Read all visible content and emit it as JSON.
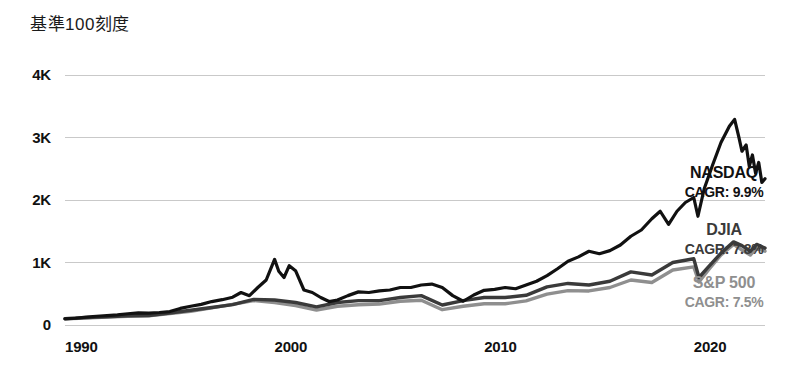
{
  "chart_data": {
    "type": "line",
    "title": "基準100刻度",
    "xlabel": "",
    "ylabel": "",
    "xlim": [
      1990,
      2023.4
    ],
    "ylim": [
      0,
      4000
    ],
    "grid": true,
    "legend_position": "right-inline",
    "y_ticks": [
      {
        "value": 0,
        "label": "0"
      },
      {
        "value": 1000,
        "label": "1K"
      },
      {
        "value": 2000,
        "label": "2K"
      },
      {
        "value": 3000,
        "label": "3K"
      },
      {
        "value": 4000,
        "label": "4K"
      }
    ],
    "x_ticks": [
      {
        "value": 1990,
        "label": "1990"
      },
      {
        "value": 2000,
        "label": "2000"
      },
      {
        "value": 2010,
        "label": "2010"
      },
      {
        "value": 2020,
        "label": "2020"
      }
    ],
    "colors": {
      "nasdaq": "#111111",
      "djia": "#3a3a3a",
      "sp500": "#8f8f8f",
      "grid": "#c9c9c9",
      "axis_text": "#111111",
      "title_text": "#1b1b1b"
    },
    "series": [
      {
        "name": "NASDAQ",
        "cagr_label": "CAGR: 9.9%",
        "color": "#111111",
        "x": [
          1990,
          1990.5,
          1991,
          1991.5,
          1992,
          1992.5,
          1993,
          1993.5,
          1994,
          1994.5,
          1995,
          1995.5,
          1996,
          1996.5,
          1997,
          1997.5,
          1998,
          1998.4,
          1998.8,
          1999.2,
          1999.6,
          2000.0,
          2000.2,
          2000.45,
          2000.7,
          2001.0,
          2001.4,
          2001.8,
          2002.2,
          2002.6,
          2003.0,
          2003.5,
          2004,
          2004.5,
          2005,
          2005.5,
          2006,
          2006.5,
          2007,
          2007.5,
          2008,
          2008.5,
          2009,
          2009.5,
          2010,
          2010.5,
          2011,
          2011.5,
          2012,
          2012.5,
          2013,
          2013.5,
          2014,
          2014.5,
          2015,
          2015.5,
          2016,
          2016.5,
          2017,
          2017.5,
          2018,
          2018.4,
          2018.8,
          2019.2,
          2019.6,
          2020.0,
          2020.2,
          2020.5,
          2020.9,
          2021.3,
          2021.7,
          2021.95,
          2022.15,
          2022.3,
          2022.5,
          2022.65,
          2022.8,
          2022.95,
          2023.1,
          2023.25,
          2023.4
        ],
        "y": [
          100,
          108,
          125,
          140,
          150,
          163,
          180,
          195,
          190,
          200,
          215,
          265,
          300,
          330,
          375,
          405,
          445,
          520,
          470,
          600,
          720,
          1050,
          860,
          760,
          950,
          870,
          560,
          520,
          440,
          375,
          400,
          470,
          530,
          520,
          545,
          560,
          600,
          600,
          640,
          655,
          600,
          470,
          380,
          480,
          555,
          570,
          600,
          580,
          640,
          700,
          790,
          900,
          1020,
          1090,
          1180,
          1140,
          1190,
          1280,
          1420,
          1520,
          1700,
          1820,
          1610,
          1820,
          1960,
          2040,
          1740,
          2180,
          2560,
          2920,
          3180,
          3290,
          3010,
          2780,
          2880,
          2540,
          2720,
          2430,
          2600,
          2280,
          2340
        ]
      },
      {
        "name": "DJIA",
        "cagr_label": "CAGR: 7.8%",
        "color": "#3a3a3a",
        "x": [
          1990,
          1991,
          1992,
          1993,
          1994,
          1995,
          1996,
          1997,
          1998,
          1999,
          2000,
          2001,
          2002,
          2003,
          2004,
          2005,
          2006,
          2007,
          2008,
          2009,
          2010,
          2011,
          2012,
          2013,
          2014,
          2015,
          2016,
          2017,
          2018,
          2019,
          2020.0,
          2020.25,
          2020.7,
          2021.3,
          2021.9,
          2022.3,
          2022.7,
          2023.0,
          2023.4
        ],
        "y": [
          100,
          118,
          130,
          148,
          150,
          192,
          235,
          280,
          325,
          410,
          400,
          360,
          290,
          360,
          390,
          390,
          440,
          470,
          320,
          390,
          440,
          440,
          475,
          610,
          665,
          640,
          700,
          850,
          800,
          1000,
          1060,
          760,
          930,
          1150,
          1330,
          1270,
          1180,
          1290,
          1230
        ]
      },
      {
        "name": "S&P 500",
        "cagr_label": "CAGR: 7.5%",
        "color": "#8f8f8f",
        "x": [
          1990,
          1991,
          1992,
          1993,
          1994,
          1995,
          1996,
          1997,
          1998,
          1999,
          2000,
          2001,
          2002,
          2003,
          2004,
          2005,
          2006,
          2007,
          2008,
          2009,
          2010,
          2011,
          2012,
          2013,
          2014,
          2015,
          2016,
          2017,
          2018,
          2019,
          2020.0,
          2020.25,
          2020.7,
          2021.3,
          2021.9,
          2022.3,
          2022.7,
          2023.0,
          2023.4
        ],
        "y": [
          100,
          113,
          128,
          138,
          148,
          185,
          220,
          275,
          330,
          390,
          360,
          310,
          240,
          300,
          325,
          335,
          380,
          395,
          245,
          300,
          340,
          340,
          385,
          495,
          550,
          545,
          600,
          720,
          680,
          880,
          930,
          690,
          880,
          1120,
          1290,
          1200,
          1120,
          1230,
          1180
        ]
      }
    ]
  }
}
